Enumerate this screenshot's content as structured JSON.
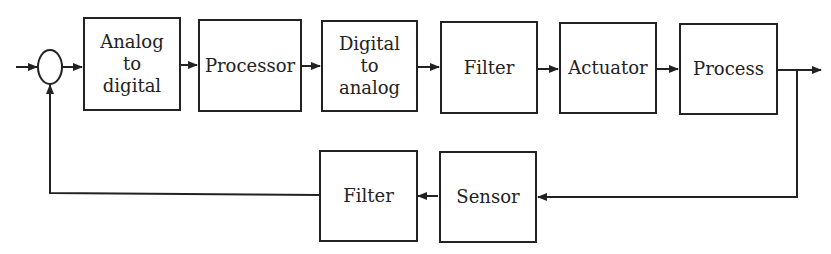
{
  "diagram": {
    "type": "closed-loop control block diagram",
    "forward_path": [
      {
        "id": "adc",
        "label": "Analog\nto\ndigital"
      },
      {
        "id": "processor",
        "label": "Processor"
      },
      {
        "id": "dac",
        "label": "Digital\nto\nanalog"
      },
      {
        "id": "filter_forward",
        "label": "Filter"
      },
      {
        "id": "actuator",
        "label": "Actuator"
      },
      {
        "id": "process",
        "label": "Process"
      }
    ],
    "feedback_path": [
      {
        "id": "sensor",
        "label": "Sensor"
      },
      {
        "id": "filter_feedback",
        "label": "Filter"
      }
    ],
    "summing_junction": {
      "shape": "ellipse"
    },
    "colors": {
      "line": "#222222",
      "background": "#ffffff"
    }
  }
}
